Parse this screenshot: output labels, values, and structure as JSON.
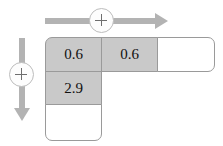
{
  "diagram": {
    "colors": {
      "filled_cell": "#c9c9c9",
      "empty_cell": "#ffffff",
      "cell_border": "#9a9a9a",
      "arrow": "#b3b3b3",
      "plus_glyph": "#6e6e6e",
      "text": "#111111"
    },
    "horizontal_control": {
      "arrow_icon_name": "arrow-right",
      "plus_icon_name": "plus-circle",
      "plus_label": "+",
      "direction": "horizontal"
    },
    "vertical_control": {
      "arrow_icon_name": "arrow-down",
      "plus_icon_name": "plus-circle",
      "plus_label": "+",
      "direction": "vertical"
    },
    "grid": {
      "rows": [
        {
          "row_index": 1,
          "cells": [
            {
              "value": "0.6",
              "state": "filled"
            },
            {
              "value": "0.6",
              "state": "filled"
            },
            {
              "value": "",
              "state": "empty"
            }
          ]
        },
        {
          "row_index": 2,
          "cells": [
            {
              "value": "2.9",
              "state": "filled"
            }
          ]
        },
        {
          "row_index": 3,
          "cells": [
            {
              "value": "",
              "state": "empty"
            }
          ]
        }
      ]
    }
  }
}
